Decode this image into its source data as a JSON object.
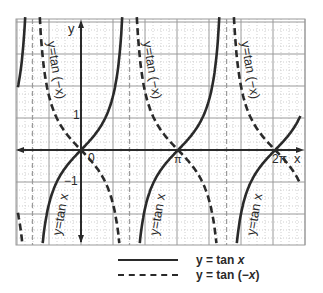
{
  "figure": {
    "axis_labels": {
      "x": "x",
      "y": "y"
    },
    "tick_labels": {
      "origin": "0",
      "pi": "π",
      "two_pi": "2π",
      "y_one": "1",
      "y_neg_one": "−1"
    },
    "curve_labels": {
      "tan_neg_x_1": "y=tan (−x)",
      "tan_neg_x_2": "y=tan (−x)",
      "tan_neg_x_3": "y=tan (−x)",
      "tan_x_1": "y=tan x",
      "tan_x_2": "y=tan x",
      "tan_x_3": "y=tan x"
    },
    "colors": {
      "ink": "#2a2a2a",
      "grid": "#9a9a9a",
      "minor_grid": "#c4c4c4"
    },
    "functions": [
      {
        "name": "tan x",
        "style": "solid"
      },
      {
        "name": "tan (-x)",
        "style": "dashed"
      }
    ],
    "domain": {
      "x_min_units": -2.05,
      "x_max_units": 7.1,
      "y_min_units": -3.0,
      "y_max_units": 4.1
    },
    "asymptotes_in_pi": [
      -0.5,
      0.5,
      1.5
    ]
  },
  "legend": {
    "items": [
      {
        "style": "solid",
        "prefix": "y = tan ",
        "var": "x",
        "suffix": ""
      },
      {
        "style": "dashed",
        "prefix": "y = tan (−",
        "var": "x",
        "suffix": ")"
      }
    ]
  }
}
